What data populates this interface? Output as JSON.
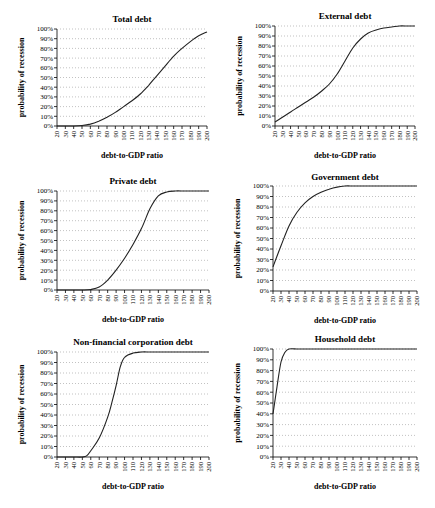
{
  "chart_data": [
    {
      "type": "line",
      "title": "Total debt",
      "xlabel": "debt-to-GDP ratio",
      "ylabel": "probability of recession",
      "x_ticks": [
        20,
        30,
        40,
        50,
        60,
        70,
        80,
        90,
        100,
        110,
        120,
        130,
        140,
        150,
        160,
        170,
        180,
        190,
        200
      ],
      "y_ticks": [
        "0%",
        "10%",
        "20%",
        "30%",
        "40%",
        "50%",
        "60%",
        "70%",
        "80%",
        "90%",
        "100%"
      ],
      "xlim": [
        20,
        200
      ],
      "ylim": [
        0,
        100
      ],
      "grid": "horizontal dotted",
      "x": [
        20,
        30,
        40,
        50,
        60,
        70,
        80,
        90,
        100,
        110,
        120,
        130,
        140,
        150,
        160,
        170,
        180,
        190,
        200
      ],
      "values": [
        0,
        0,
        0,
        0.5,
        2,
        5,
        9,
        14,
        20,
        26,
        33,
        42,
        52,
        62,
        72,
        80,
        87,
        93,
        97
      ]
    },
    {
      "type": "line",
      "title": "External debt",
      "xlabel": "debt-to-GDP ratio",
      "ylabel": "probability of recession",
      "x_ticks": [
        20,
        30,
        40,
        50,
        60,
        70,
        80,
        90,
        100,
        110,
        120,
        130,
        140,
        150,
        160,
        170,
        180,
        190,
        200
      ],
      "y_ticks": [
        "0%",
        "10%",
        "20%",
        "30%",
        "40%",
        "50%",
        "60%",
        "70%",
        "80%",
        "90%",
        "100%"
      ],
      "xlim": [
        20,
        200
      ],
      "ylim": [
        0,
        100
      ],
      "grid": "horizontal dotted",
      "x": [
        20,
        30,
        40,
        50,
        60,
        70,
        80,
        90,
        100,
        110,
        120,
        130,
        140,
        150,
        160,
        170,
        180,
        190,
        200
      ],
      "values": [
        4,
        9,
        14,
        19,
        24,
        29,
        35,
        42,
        52,
        65,
        78,
        87,
        93,
        96,
        98,
        99,
        100,
        100,
        100
      ]
    },
    {
      "type": "line",
      "title": "Private debt",
      "xlabel": "debt-to-GDP ratio",
      "ylabel": "probability of recession",
      "x_ticks": [
        20,
        30,
        40,
        50,
        60,
        70,
        80,
        90,
        100,
        110,
        120,
        130,
        140,
        150,
        160,
        170,
        180,
        190,
        200
      ],
      "y_ticks": [
        "0%",
        "10%",
        "20%",
        "30%",
        "40%",
        "50%",
        "60%",
        "70%",
        "80%",
        "90%",
        "100%"
      ],
      "xlim": [
        20,
        200
      ],
      "ylim": [
        0,
        100
      ],
      "grid": "horizontal dotted",
      "x": [
        20,
        30,
        40,
        50,
        60,
        70,
        80,
        90,
        100,
        110,
        120,
        130,
        140,
        150,
        160,
        170,
        180,
        190,
        200
      ],
      "values": [
        0,
        0,
        0,
        0,
        0.5,
        3,
        10,
        20,
        32,
        46,
        62,
        82,
        95,
        99,
        100,
        100,
        100,
        100,
        100
      ]
    },
    {
      "type": "line",
      "title": "Government debt",
      "xlabel": "debt-to-GDP ratio",
      "ylabel": "probability of recession",
      "x_ticks": [
        20,
        30,
        40,
        50,
        60,
        70,
        80,
        90,
        100,
        110,
        120,
        130,
        140,
        150,
        160,
        170,
        180,
        190,
        200
      ],
      "y_ticks": [
        "0%",
        "10%",
        "20%",
        "30%",
        "40%",
        "50%",
        "60%",
        "70%",
        "80%",
        "90%",
        "100%"
      ],
      "xlim": [
        20,
        200
      ],
      "ylim": [
        0,
        100
      ],
      "grid": "horizontal dotted",
      "x": [
        20,
        30,
        40,
        50,
        60,
        70,
        80,
        90,
        100,
        110,
        120,
        130,
        140,
        150,
        160,
        170,
        180,
        190,
        200
      ],
      "values": [
        23,
        43,
        62,
        75,
        84,
        90,
        94,
        97,
        99,
        100,
        100,
        100,
        100,
        100,
        100,
        100,
        100,
        100,
        100
      ]
    },
    {
      "type": "line",
      "title": "Non-financial corporation debt",
      "xlabel": "debt-to-GDP ratio",
      "ylabel": "probability of recession",
      "x_ticks": [
        20,
        30,
        40,
        50,
        60,
        70,
        80,
        90,
        100,
        110,
        120,
        130,
        140,
        150,
        160,
        170,
        180,
        190,
        200
      ],
      "y_ticks": [
        "0%",
        "10%",
        "20%",
        "30%",
        "40%",
        "50%",
        "60%",
        "70%",
        "80%",
        "90%",
        "100%"
      ],
      "xlim": [
        20,
        200
      ],
      "ylim": [
        0,
        100
      ],
      "grid": "horizontal dotted",
      "x": [
        20,
        30,
        40,
        50,
        55,
        60,
        70,
        80,
        85,
        90,
        95,
        100,
        110,
        120,
        130,
        140,
        150,
        160,
        170,
        180,
        190,
        200
      ],
      "values": [
        0,
        0,
        0,
        0,
        1,
        6,
        18,
        38,
        52,
        68,
        86,
        95,
        99,
        100,
        100,
        100,
        100,
        100,
        100,
        100,
        100,
        100
      ]
    },
    {
      "type": "line",
      "title": "Household debt",
      "xlabel": "debt-to-GDP ratio",
      "ylabel": "probability of recession",
      "x_ticks": [
        20,
        30,
        40,
        50,
        60,
        70,
        80,
        90,
        100,
        110,
        120,
        130,
        140,
        150,
        160,
        170,
        180,
        190,
        200
      ],
      "y_ticks": [
        "0%",
        "10%",
        "20%",
        "30%",
        "40%",
        "50%",
        "60%",
        "70%",
        "80%",
        "90%",
        "100%"
      ],
      "xlim": [
        20,
        200
      ],
      "ylim": [
        0,
        100
      ],
      "grid": "horizontal dotted",
      "x": [
        20,
        25,
        30,
        35,
        40,
        50,
        60,
        70,
        80,
        90,
        100,
        110,
        120,
        130,
        140,
        150,
        160,
        170,
        180,
        190,
        200
      ],
      "values": [
        40,
        65,
        88,
        97,
        100,
        100,
        100,
        100,
        100,
        100,
        100,
        100,
        100,
        100,
        100,
        100,
        100,
        100,
        100,
        100,
        100
      ]
    }
  ],
  "layout": [
    {
      "left": 57,
      "right": 207,
      "top": 29,
      "bottom": 126,
      "cx": 132,
      "titleY": 22
    },
    {
      "left": 275,
      "right": 415,
      "top": 26,
      "bottom": 126,
      "cx": 345,
      "titleY": 19
    },
    {
      "left": 57,
      "right": 209,
      "top": 191,
      "bottom": 290,
      "cx": 133,
      "titleY": 184
    },
    {
      "left": 273,
      "right": 417,
      "top": 186,
      "bottom": 291,
      "cx": 345,
      "titleY": 180
    },
    {
      "left": 57,
      "right": 209,
      "top": 352,
      "bottom": 457,
      "cx": 133,
      "titleY": 345
    },
    {
      "left": 273,
      "right": 417,
      "top": 349,
      "bottom": 457,
      "cx": 345,
      "titleY": 342
    }
  ]
}
